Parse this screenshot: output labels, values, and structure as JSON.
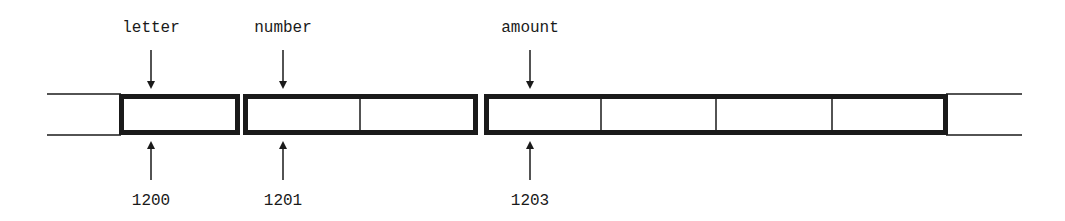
{
  "diagram": {
    "type": "memory-layout",
    "colors": {
      "stroke": "#1a1a1a",
      "background": "#ffffff"
    },
    "variables": [
      {
        "name": "letter",
        "address": "1200",
        "cells": 1
      },
      {
        "name": "number",
        "address": "1201",
        "cells": 2
      },
      {
        "name": "amount",
        "address": "1203",
        "cells": 4
      }
    ]
  }
}
